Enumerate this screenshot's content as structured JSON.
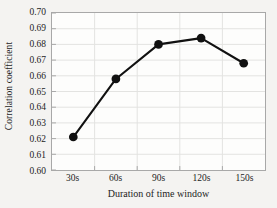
{
  "chart_data": {
    "type": "line",
    "title": "",
    "subtitle": "",
    "xlabel": "Duration of time window",
    "ylabel": "Correlation coefficient",
    "categories": [
      "30s",
      "60s",
      "90s",
      "120s",
      "150s"
    ],
    "values": [
      0.621,
      0.658,
      0.68,
      0.684,
      0.668
    ],
    "series": [
      {
        "name": "Correlation coefficient",
        "values": [
          0.621,
          0.658,
          0.68,
          0.684,
          0.668
        ]
      }
    ],
    "ylim": [
      0.6,
      0.7
    ],
    "ytick_step": 0.01,
    "ytick_labels": [
      "0.70",
      "0.69",
      "0.68",
      "0.67",
      "0.66",
      "0.65",
      "0.64",
      "0.63",
      "0.62",
      "0.61",
      "0.60"
    ],
    "ytick_values": [
      0.7,
      0.69,
      0.68,
      0.67,
      0.66,
      0.65,
      0.64,
      0.63,
      0.62,
      0.61,
      0.6
    ],
    "xtick_labels": [
      "30s",
      "60s",
      "90s",
      "120s",
      "150s"
    ],
    "grid": true,
    "grid_horizontal": true,
    "grid_vertical": true,
    "legend": false,
    "legend_position": "none",
    "marker": "circle",
    "marker_filled": true,
    "annotations": []
  },
  "style": {
    "line_color": "#111111",
    "marker_color": "#111111",
    "grid_color": "#e3e3e1",
    "axis_color": "#a8a8a8",
    "text_color": "#1d1d1d",
    "plot_background": "#fdfdfc",
    "page_background": "#f4f3f1"
  }
}
